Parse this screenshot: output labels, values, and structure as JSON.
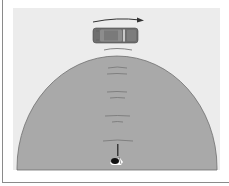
{
  "figure": {
    "colors": {
      "background": "#ffffff",
      "panel": "#ececec",
      "dome_fill": "#a9a9a9",
      "dome_edge": "#6e6e6e",
      "car_body": "#6f6f6f",
      "car_roof": "#9a9a9a",
      "wave": "#7b7b7b",
      "arrow": "#333333",
      "frame": "#8a8a8a"
    },
    "elements": {
      "motion_arrow": "arrow-right",
      "car": "car-top-view",
      "person": "listener-top-view",
      "wave_count": 5
    }
  }
}
